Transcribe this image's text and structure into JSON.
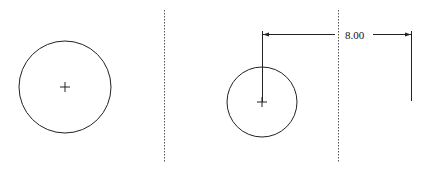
{
  "diagram": {
    "type": "dimension-drawing",
    "panels": [
      {
        "id": "left",
        "circle": {
          "cx": 65,
          "cy": 87,
          "r": 46
        },
        "center_mark": true
      },
      {
        "id": "right",
        "circle": {
          "cx": 262,
          "cy": 102,
          "r": 35
        },
        "center_mark": true,
        "dimension": {
          "label": "8.00",
          "y": 34,
          "x_start": 262,
          "x_end": 411,
          "left_extension": {
            "x": 262,
            "y1": 31,
            "y2": 102
          },
          "right_extension": {
            "x": 411,
            "y1": 31,
            "y2": 101
          }
        }
      }
    ],
    "dividers": [
      {
        "x": 164,
        "y1": 10,
        "y2": 162,
        "style": "dotted"
      },
      {
        "x": 338,
        "y1": 10,
        "y2": 162,
        "style": "dotted"
      }
    ],
    "colors": {
      "line": "#222222",
      "divider": "#555555",
      "background": "#ffffff"
    }
  }
}
